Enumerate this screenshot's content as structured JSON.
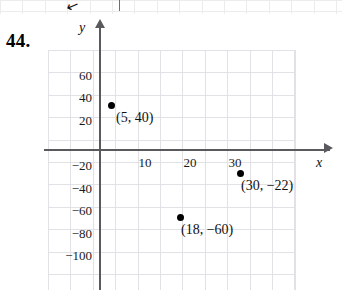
{
  "problem": {
    "number": "44."
  },
  "bleed": {
    "arrow_glyph": "↙",
    "tick": ""
  },
  "axes": {
    "x_label": "x",
    "y_label": "y",
    "x_ticks": [
      {
        "label": "10",
        "value": 10
      },
      {
        "label": "20",
        "value": 20
      },
      {
        "label": "30",
        "value": 30
      }
    ],
    "y_ticks": [
      {
        "label": "60",
        "value": 60
      },
      {
        "label": "40",
        "value": 40
      },
      {
        "label": "20",
        "value": 20
      },
      {
        "label": "−20",
        "value": -20
      },
      {
        "label": "−40",
        "value": -40
      },
      {
        "label": "−60",
        "value": -60
      },
      {
        "label": "−80",
        "value": -80
      },
      {
        "label": "−100",
        "value": -100
      }
    ]
  },
  "chart_data": {
    "type": "scatter",
    "title": "",
    "xlabel": "x",
    "ylabel": "y",
    "grid": true,
    "legend": "none",
    "xlim": [
      -2.5,
      40
    ],
    "ylim": [
      -107,
      72
    ],
    "x_ticks": [
      10,
      20,
      30
    ],
    "y_ticks": [
      60,
      40,
      20,
      -20,
      -40,
      -60,
      -80,
      -100
    ],
    "points": [
      {
        "x": 5,
        "y": 40,
        "label": "(5, 40)"
      },
      {
        "x": 18,
        "y": -60,
        "label": "(18, −60)"
      },
      {
        "x": 30,
        "y": -22,
        "label": "(30, −22)"
      }
    ]
  }
}
